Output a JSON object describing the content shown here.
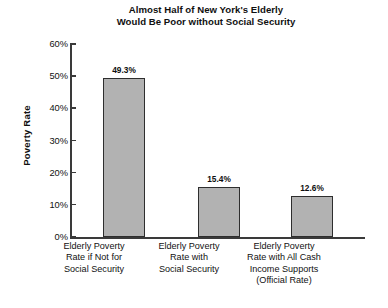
{
  "chart_data": {
    "type": "bar",
    "title": "Almost Half of New York's Elderly Would Be Poor without Social Security",
    "title_lines": [
      "Almost Half of New York's Elderly",
      "Would Be Poor without Social Security"
    ],
    "xlabel": "",
    "ylabel": "Poverty Rate",
    "ylim": [
      0,
      60
    ],
    "ytick_values": [
      60,
      50,
      40,
      30,
      20,
      10,
      0
    ],
    "ytick_labels": [
      "60%",
      "50%",
      "40%",
      "30%",
      "20%",
      "10%",
      "0%"
    ],
    "grid": false,
    "legend": false,
    "categories": [
      "Elderly Poverty Rate if Not for Social Security",
      "Elderly Poverty Rate with Social Security",
      "Elderly Poverty Rate with All Cash Income Supports (Official Rate)"
    ],
    "category_lines": [
      [
        "Elderly Poverty",
        "Rate if Not for",
        "Social Security"
      ],
      [
        "Elderly Poverty",
        "Rate with",
        "Social Security"
      ],
      [
        "Elderly Poverty",
        "Rate with All Cash",
        "Income Supports",
        "(Official Rate)"
      ]
    ],
    "values": [
      49.3,
      15.4,
      12.6
    ],
    "value_labels": [
      "49.3%",
      "15.4%",
      "12.6%"
    ],
    "bar_fill_color": "#b2b2b2",
    "bar_border_color": "#2e2e2e",
    "axis_color": "#3a3a3a",
    "background_color": "#ffffff"
  }
}
